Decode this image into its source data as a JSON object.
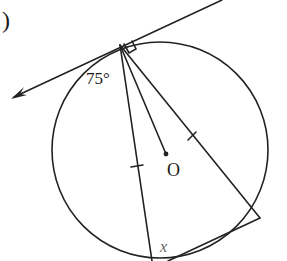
{
  "diagram": {
    "part_marker": ")",
    "angle_label": "75°",
    "center_label": "O",
    "unknown_label": "x",
    "colors": {
      "ink": "#222222",
      "unknown_label": "#666666",
      "background": "#ffffff"
    },
    "elements": {
      "circle": {
        "cx": 160,
        "cy": 150,
        "r": 108,
        "center_name": "O"
      },
      "tangent_line": {
        "from": [
          222,
          0
        ],
        "to": [
          12,
          98
        ],
        "arrow_end": "lower-left",
        "touch_point": [
          120,
          45
        ]
      },
      "right_angle_mark": {
        "at": [
          120,
          45
        ]
      },
      "chords": [
        {
          "from": [
            120,
            45
          ],
          "to": [
            152,
            260
          ],
          "tick_marks": 1
        },
        {
          "from": [
            120,
            45
          ],
          "to": [
            260,
            218
          ],
          "tick_marks": 1
        },
        {
          "from": [
            260,
            218
          ],
          "to": [
            152,
            260
          ],
          "tick_marks": 0
        }
      ],
      "radius": {
        "from": [
          120,
          45
        ],
        "to": [
          166,
          154
        ]
      }
    }
  }
}
